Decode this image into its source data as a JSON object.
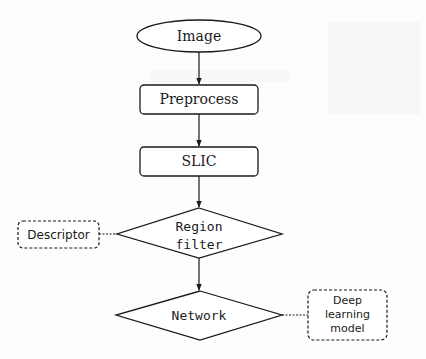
{
  "diagram": {
    "type": "flowchart",
    "colors": {
      "stroke": "#1a1a1a",
      "text": "#1a1a1a",
      "background": "#fdfdfd"
    },
    "nodes": [
      {
        "id": "image",
        "shape": "ellipse",
        "label": "Image"
      },
      {
        "id": "preprocess",
        "shape": "rounded-rect",
        "label": "Preprocess"
      },
      {
        "id": "slic",
        "shape": "rounded-rect",
        "label": "SLIC"
      },
      {
        "id": "region_filter",
        "shape": "diamond",
        "label_lines": [
          "Region",
          "filter"
        ]
      },
      {
        "id": "network",
        "shape": "diamond",
        "label": "Network"
      },
      {
        "id": "descriptor",
        "shape": "dashed-rounded-rect",
        "label": "Descriptor"
      },
      {
        "id": "deep_learning_model",
        "shape": "dashed-rounded-rect",
        "label_lines": [
          "Deep",
          "learning",
          "model"
        ]
      }
    ],
    "edges": [
      {
        "from": "image",
        "to": "preprocess",
        "style": "solid-arrow"
      },
      {
        "from": "preprocess",
        "to": "slic",
        "style": "solid-arrow"
      },
      {
        "from": "slic",
        "to": "region_filter",
        "style": "solid-arrow"
      },
      {
        "from": "region_filter",
        "to": "network",
        "style": "solid-arrow"
      },
      {
        "from": "descriptor",
        "to": "region_filter",
        "style": "dotted-line"
      },
      {
        "from": "deep_learning_model",
        "to": "network",
        "style": "dotted-line"
      }
    ]
  }
}
